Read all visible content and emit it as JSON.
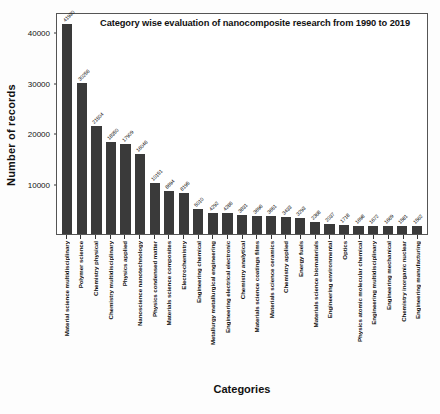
{
  "chart_data": {
    "type": "bar",
    "title": "Category wise evaluation of nanocomposite research from 1990 to 2019",
    "xlabel": "Categories",
    "ylabel": "Number of records",
    "ylim": [
      0,
      44000
    ],
    "yticks": [
      10000,
      20000,
      30000,
      40000
    ],
    "ytick_labels": [
      "10000",
      "20000",
      "30000",
      "40000"
    ],
    "grid": false,
    "legend": "none",
    "bar_color": "#3a3a3a",
    "categories": [
      "Material science multidisciplinary",
      "Polymer science",
      "Chemistry physical",
      "Chemistry multidisciplinary",
      "Physics applied",
      "Nanoscience nanotechnology",
      "Physics condensed matter",
      "Materials science composites",
      "Electrochemistry",
      "Engineering chemical",
      "Metallurgy metallurgical engineering",
      "Engineering electrical electronic",
      "Chemistry analytical",
      "Materials science coatings films",
      "Materials science ceramics",
      "Chemistry applied",
      "Energy fuels",
      "Materials science biomaterials",
      "Engineering environmental",
      "Optics",
      "Physics atomic molecular chemical",
      "Engineering multidisciplinary",
      "Engineering mechanical",
      "Chemistry inorganic nuclear",
      "Engineering manufacturing"
    ],
    "values": [
      41930,
      30256,
      21504,
      18350,
      17909,
      16046,
      10151,
      8694,
      8195,
      5010,
      4292,
      4286,
      3831,
      3696,
      3651,
      3433,
      3293,
      2368,
      2037,
      1718,
      1698,
      1672,
      1669,
      1581,
      1562
    ],
    "value_labels": [
      "41930",
      "30256",
      "21504",
      "18350",
      "17909",
      "16046",
      "10151",
      "8694",
      "8195",
      "5010",
      "4292",
      "4286",
      "3831",
      "3696",
      "3651",
      "3433",
      "3293",
      "2368",
      "2037",
      "1718",
      "1698",
      "1672",
      "1669",
      "1581",
      "1562"
    ]
  }
}
